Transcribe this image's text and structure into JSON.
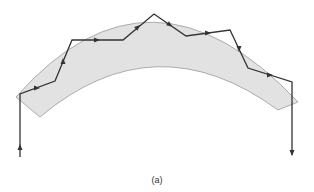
{
  "figure": {
    "caption": "(a)",
    "colors": {
      "fiber_fill": "#e2e2e2",
      "fiber_edge": "#9a9a9a",
      "ray": "#333333"
    },
    "fiber": {
      "outer_arc": "M16,97 Q150,-55 298,102",
      "inner_arc": "M278,110 Q155,20 40,117"
    },
    "ray_path": [
      [
        20,
        157
      ],
      [
        20,
        94
      ],
      [
        55,
        81
      ],
      [
        72,
        40
      ],
      [
        123,
        40
      ],
      [
        154,
        14
      ],
      [
        186,
        36
      ],
      [
        230,
        30
      ],
      [
        248,
        68
      ],
      [
        292,
        82
      ],
      [
        292,
        155
      ]
    ],
    "arrows": [
      {
        "x": 20,
        "y": 147,
        "dir": "up"
      },
      {
        "x": 37,
        "y": 88,
        "dir": "right"
      },
      {
        "x": 63,
        "y": 61,
        "dir": "up"
      },
      {
        "x": 97,
        "y": 40,
        "dir": "right"
      },
      {
        "x": 138,
        "y": 27,
        "dir": "up-right"
      },
      {
        "x": 170,
        "y": 25,
        "dir": "down-right"
      },
      {
        "x": 208,
        "y": 33,
        "dir": "right"
      },
      {
        "x": 239,
        "y": 49,
        "dir": "down"
      },
      {
        "x": 270,
        "y": 75,
        "dir": "right"
      },
      {
        "x": 292,
        "y": 153,
        "dir": "down"
      }
    ]
  }
}
